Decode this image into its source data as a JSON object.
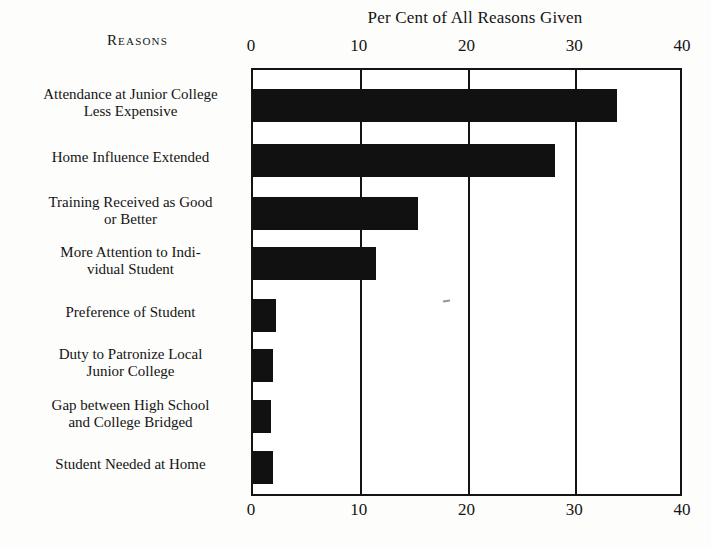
{
  "chart_data": {
    "type": "bar",
    "orientation": "horizontal",
    "title": "Per Cent of All Reasons Given",
    "row_header": "Reasons",
    "xlabel": "Per Cent of All Reasons Given",
    "ylabel": "Reasons",
    "xlim": [
      0,
      40
    ],
    "xticks": [
      0,
      10,
      20,
      30,
      40
    ],
    "xtick_labels": [
      "0",
      "10",
      "20",
      "30",
      "40"
    ],
    "xticks_top": [
      "0",
      "10",
      "20",
      "30",
      "40"
    ],
    "xticks_bottom": [
      "0",
      "10",
      "20",
      "30",
      "40"
    ],
    "grid": true,
    "legend": false,
    "bar_color": "#111111",
    "categories": [
      "Attendance at Junior College Less Expensive",
      "Home Influence Extended",
      "Training Received as Good or Better",
      "More Attention to Individual Student",
      "Preference of Student",
      "Duty to Patronize Local Junior College",
      "Gap between High School and College Bridged",
      "Student Needed at Home"
    ],
    "values": [
      33.8,
      28.0,
      15.3,
      11.4,
      2.1,
      1.9,
      1.7,
      1.9
    ]
  },
  "rows": [
    {
      "line1": "Attendance at Junior College",
      "line2": "Less Expensive",
      "value": 33.8
    },
    {
      "line1": "Home Influence Extended",
      "line2": "",
      "value": 28.0
    },
    {
      "line1": "Training Received as Good",
      "line2": "or Better",
      "value": 15.3
    },
    {
      "line1": "More Attention to Indi-",
      "line2": "vidual Student",
      "value": 11.4
    },
    {
      "line1": "Preference of Student",
      "line2": "",
      "value": 2.1
    },
    {
      "line1": "Duty to Patronize Local",
      "line2": "Junior College",
      "value": 1.9
    },
    {
      "line1": "Gap between High School",
      "line2": "and College Bridged",
      "value": 1.7
    },
    {
      "line1": "Student Needed at Home",
      "line2": "",
      "value": 1.9
    }
  ]
}
